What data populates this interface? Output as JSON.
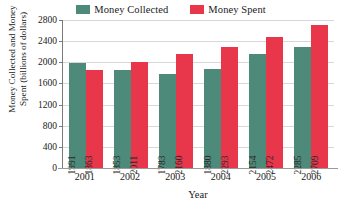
{
  "legend": {
    "position": "top-center",
    "entries": [
      {
        "label": "Money Collected",
        "color": "#4d8a79",
        "swatch_name": "legend-swatch-money-collected"
      },
      {
        "label": "Money Spent",
        "color": "#e8364b",
        "swatch_name": "legend-swatch-money-spent"
      }
    ]
  },
  "axes": {
    "y_title_line1": "Money Collected and Money",
    "y_title_line2": "Spent (billions of dollars)",
    "x_title": "Year",
    "y_ticks": [
      2800,
      2400,
      2000,
      1600,
      1200,
      800,
      400,
      0
    ]
  },
  "chart_data": {
    "type": "bar",
    "title": "",
    "subtitle": "",
    "xlabel": "Year",
    "ylabel": "Money Collected and Money Spent (billions of dollars)",
    "categories": [
      "2001",
      "2002",
      "2003",
      "2004",
      "2005",
      "2006"
    ],
    "series": [
      {
        "name": "Money Collected",
        "color": "#4d8a79",
        "values": [
          1991,
          1853,
          1783,
          1880,
          2154,
          2285
        ]
      },
      {
        "name": "Money Spent",
        "color": "#e8364b",
        "values": [
          1863,
          2011,
          2160,
          2293,
          2472,
          2709
        ]
      }
    ],
    "ylim": [
      0,
      2800
    ],
    "ytick_step": 400,
    "yticks": [
      0,
      400,
      800,
      1200,
      1600,
      2000,
      2400,
      2800
    ],
    "xticks": [
      "2001",
      "2002",
      "2003",
      "2004",
      "2005",
      "2006"
    ],
    "grid": "horizontal",
    "data_labels": "inside-bar-rotated",
    "legend_position": "top-center"
  }
}
